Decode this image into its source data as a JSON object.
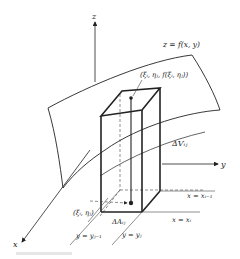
{
  "diagram": {
    "type": "3d-volume-element",
    "axes": {
      "z": "z",
      "y": "y",
      "x": "x"
    },
    "surface_label": "z = f(x, y)",
    "point_top_label": "(ξᵢ, ηⱼ, f(ξᵢ, ηⱼ))",
    "point_base_label": "(ξᵢ, ηⱼ)",
    "volume_label": "ΔVᵢⱼ",
    "area_label": "ΔAᵢⱼ",
    "grid_lines": {
      "x_prev": "x = xᵢ₋₁",
      "x_curr": "x = xᵢ",
      "y_prev": "y = yⱼ₋₁",
      "y_curr": "y = yⱼ"
    },
    "colors": {
      "line": "#222222",
      "thin_line": "#444444",
      "background": "#ffffff"
    }
  }
}
